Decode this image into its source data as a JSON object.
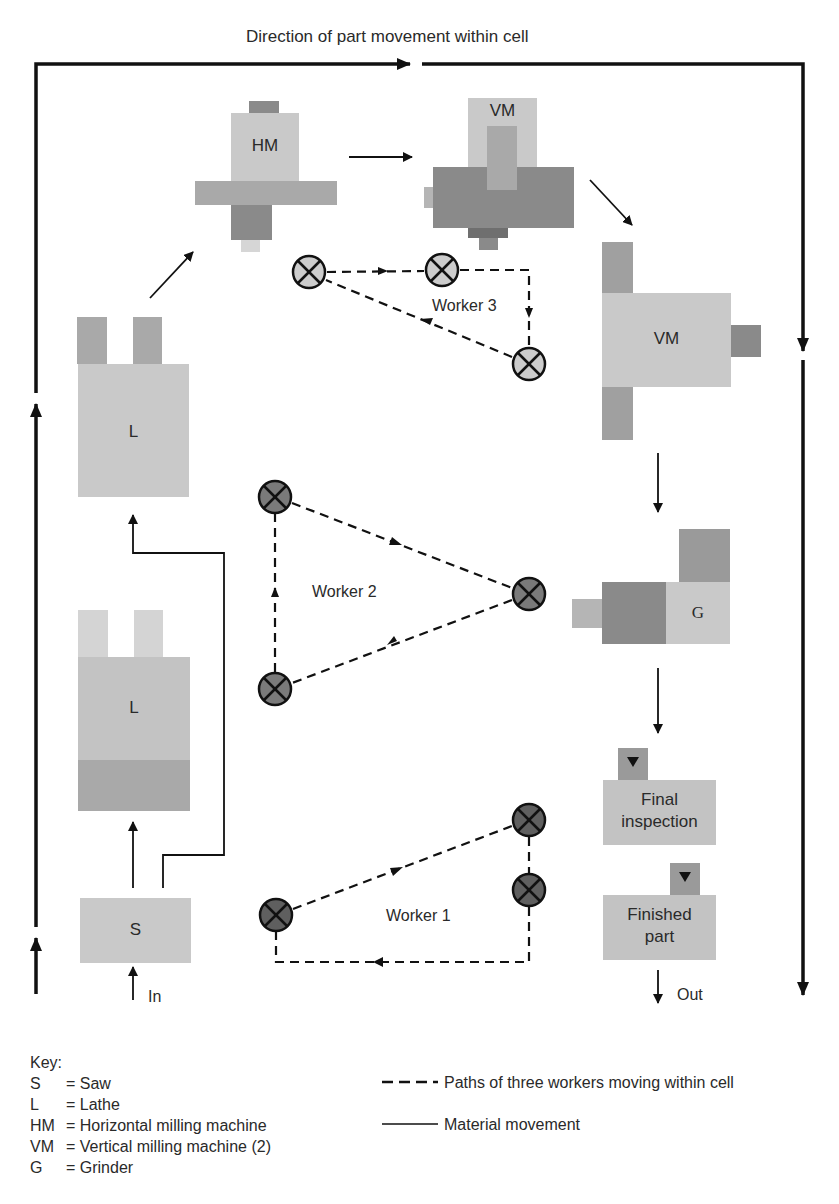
{
  "title": "Direction of part movement within cell",
  "colors": {
    "light": "#c9c9c9",
    "mid": "#a9a9a9",
    "dark": "#8a8a8a",
    "line": "#111111",
    "worker3_fill": "#cccccc",
    "worker2_fill": "#7a7a7a",
    "worker1_fill": "#5f5f5f"
  },
  "machines": {
    "hm": {
      "label": "HM"
    },
    "vm_top": {
      "label": "VM"
    },
    "vm_right": {
      "label": "VM"
    },
    "lathe_upper": {
      "label": "L"
    },
    "lathe_lower": {
      "label": "L"
    },
    "saw": {
      "label": "S"
    },
    "grinder": {
      "label": "G"
    },
    "final_inspection": {
      "label_line1": "Final",
      "label_line2": "inspection"
    },
    "finished_part": {
      "label_line1": "Finished",
      "label_line2": "part"
    }
  },
  "flow": {
    "in_label": "In",
    "out_label": "Out"
  },
  "workers": [
    {
      "label": "Worker 1",
      "stations": [
        [
          276,
          915
        ],
        [
          529,
          820
        ],
        [
          529,
          890
        ]
      ]
    },
    {
      "label": "Worker 2",
      "stations": [
        [
          275,
          497
        ],
        [
          529,
          594
        ],
        [
          275,
          689
        ]
      ]
    },
    {
      "label": "Worker 3",
      "stations": [
        [
          309,
          272
        ],
        [
          442,
          270
        ],
        [
          529,
          364
        ]
      ]
    }
  ],
  "key": {
    "heading": "Key:",
    "items": [
      {
        "symbol": "S",
        "text": "= Saw"
      },
      {
        "symbol": "L",
        "text": "= Lathe"
      },
      {
        "symbol": "HM",
        "text": "= Horizontal milling machine"
      },
      {
        "symbol": "VM",
        "text": "= Vertical milling machine (2)"
      },
      {
        "symbol": "G",
        "text": "= Grinder"
      }
    ],
    "legend": [
      {
        "style": "dashed",
        "text": "Paths of three workers moving within cell"
      },
      {
        "style": "solid",
        "text": "Material movement"
      }
    ]
  }
}
